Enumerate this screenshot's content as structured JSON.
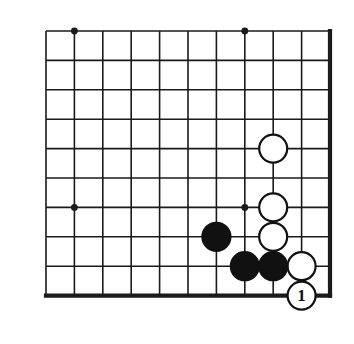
{
  "figure": {
    "board_color": "#ffffff",
    "line_color": "#1a1a1a",
    "black_stone_color": "#111111",
    "white_stone_color": "#ffffff",
    "white_stone_outline": "#111111",
    "label_color": "#111111"
  },
  "grid": {
    "columns": 11,
    "rows": 10,
    "x_positions": [
      46,
      74.4,
      102.8,
      131.2,
      159.6,
      188,
      216.4,
      244.8,
      273.2,
      301.6,
      330
    ],
    "y_positions": [
      31,
      60.4,
      89.8,
      119.2,
      148.6,
      178,
      207.4,
      236.8,
      266.2,
      295.6
    ],
    "thin_line_width": 1.6,
    "edge_line_width": 4.2,
    "edges": {
      "right_edge_column_index": 10,
      "bottom_edge_row_index": 9
    },
    "star_points": [
      {
        "col": 1,
        "row": 0
      },
      {
        "col": 7,
        "row": 0
      },
      {
        "col": 1,
        "row": 6
      },
      {
        "col": 7,
        "row": 6
      }
    ],
    "star_point_radius": 3.4
  },
  "stones": {
    "radius": 14,
    "outline_width": 2.2,
    "items": [
      {
        "name": "white-stone-a",
        "color": "white",
        "col": 8,
        "row": 4,
        "label": ""
      },
      {
        "name": "white-stone-b",
        "color": "white",
        "col": 8,
        "row": 6,
        "label": ""
      },
      {
        "name": "white-stone-c",
        "color": "white",
        "col": 8,
        "row": 7,
        "label": ""
      },
      {
        "name": "white-stone-d",
        "color": "white",
        "col": 9,
        "row": 8,
        "label": ""
      },
      {
        "name": "black-stone-a",
        "color": "black",
        "col": 6,
        "row": 7,
        "label": ""
      },
      {
        "name": "black-stone-b",
        "color": "black",
        "col": 7,
        "row": 8,
        "label": ""
      },
      {
        "name": "black-stone-c",
        "color": "black",
        "col": 8,
        "row": 8,
        "label": ""
      },
      {
        "name": "white-stone-move-1",
        "color": "white",
        "col": 9,
        "row": 9,
        "label": "1"
      }
    ]
  },
  "move_label": {
    "text": "1",
    "font_size": 17
  }
}
